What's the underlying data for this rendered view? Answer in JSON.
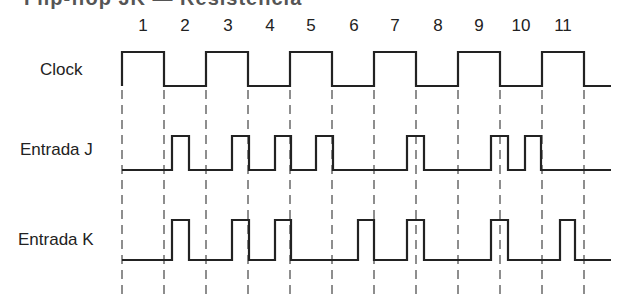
{
  "title_clipped": "Flip-flop JK — Resistencia",
  "periods": [
    "1",
    "2",
    "3",
    "4",
    "5",
    "6",
    "7",
    "8",
    "9",
    "10",
    "11"
  ],
  "period_x": [
    143,
    185,
    228,
    270,
    311,
    354,
    395,
    438,
    479,
    521,
    563
  ],
  "signals": [
    {
      "name": "Clock",
      "label_x": 40,
      "label_y": 60
    },
    {
      "name": "Entrada J",
      "label_x": 20,
      "label_y": 140
    },
    {
      "name": "Entrada K",
      "label_x": 18,
      "label_y": 230
    }
  ],
  "edges_x": [
    122,
    164,
    206,
    248,
    290,
    332,
    374,
    416,
    458,
    500,
    542,
    584
  ],
  "clock": {
    "high_y": 52,
    "low_y": 86,
    "start_x": 122,
    "end_x": 611,
    "transitions": [
      122,
      164,
      206,
      248,
      290,
      332,
      374,
      416,
      458,
      500,
      542,
      584
    ]
  },
  "j_input": {
    "high_y": 136,
    "low_y": 170,
    "start_x": 122,
    "end_x": 611,
    "pulses": [
      [
        172,
        189
      ],
      [
        232,
        249
      ],
      [
        275,
        291
      ],
      [
        316,
        333
      ],
      [
        407,
        424
      ],
      [
        491,
        508
      ],
      [
        525,
        541
      ]
    ]
  },
  "k_input": {
    "high_y": 220,
    "low_y": 260,
    "start_x": 122,
    "end_x": 611,
    "pulses": [
      [
        172,
        189
      ],
      [
        232,
        249
      ],
      [
        275,
        291
      ],
      [
        358,
        374
      ],
      [
        407,
        424
      ],
      [
        491,
        508
      ],
      [
        560,
        575
      ]
    ]
  },
  "colors": {
    "line": "#222222",
    "dash": "#444444"
  },
  "chart_data": {
    "type": "table",
    "columns": [
      "Period",
      "J",
      "K"
    ],
    "rows": [
      [
        "1",
        0,
        0
      ],
      [
        "2",
        1,
        1
      ],
      [
        "3",
        1,
        1
      ],
      [
        "4",
        1,
        1
      ],
      [
        "5",
        1,
        0
      ],
      [
        "6",
        0,
        1
      ],
      [
        "7",
        1,
        1
      ],
      [
        "8",
        0,
        0
      ],
      [
        "9",
        1,
        1
      ],
      [
        "10",
        1,
        0
      ],
      [
        "11",
        0,
        1
      ]
    ]
  }
}
